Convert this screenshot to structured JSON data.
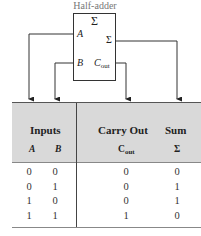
{
  "diagram": {
    "title": "Half-adder",
    "block": {
      "symbol": "Σ",
      "inputs": [
        {
          "name": "A"
        },
        {
          "name": "B"
        }
      ],
      "outputs": [
        {
          "name": "Σ"
        },
        {
          "base": "C",
          "sub": "out"
        }
      ]
    },
    "wire_color": "#333333",
    "header_bg": "#d9d9d9"
  },
  "table": {
    "groups": [
      {
        "label": "Inputs"
      },
      {
        "label": "Carry Out"
      },
      {
        "label": "Sum"
      }
    ],
    "columns": {
      "a": "A",
      "b": "B",
      "cout_base": "C",
      "cout_sub": "out",
      "sum": "Σ"
    },
    "rows": [
      {
        "a": "0",
        "b": "0",
        "cout": "0",
        "sum": "0"
      },
      {
        "a": "0",
        "b": "1",
        "cout": "0",
        "sum": "1"
      },
      {
        "a": "1",
        "b": "0",
        "cout": "0",
        "sum": "1"
      },
      {
        "a": "1",
        "b": "1",
        "cout": "1",
        "sum": "0"
      }
    ]
  }
}
